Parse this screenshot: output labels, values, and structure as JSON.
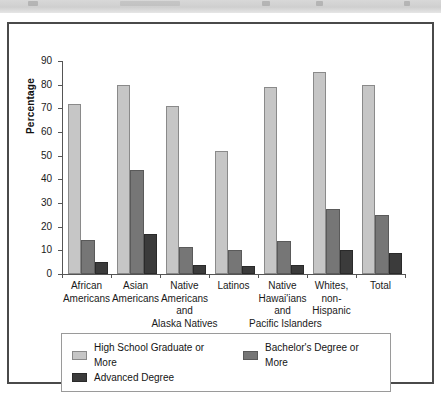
{
  "figure": {
    "top_band_present": true,
    "frame_border_color": "#4a4a4a"
  },
  "chart_data": {
    "type": "bar",
    "title": "",
    "xlabel": "",
    "ylabel": "Percentage",
    "ylim": [
      0,
      90
    ],
    "yticks": [
      0,
      10,
      20,
      30,
      40,
      50,
      60,
      70,
      80,
      90
    ],
    "grid": false,
    "legend_position": "bottom",
    "categories": [
      "African\nAmericans",
      "Asian\nAmericans",
      "Native\nAmericans\nand\nAlaska Natives",
      "Latinos",
      "Native\nHawai'ians\nand\nPacific Islanders",
      "Whites,\nnon-\nHispanic",
      "Total"
    ],
    "category_lines": [
      [
        "African",
        "Americans"
      ],
      [
        "Asian",
        "Americans"
      ],
      [
        "Native",
        "Americans",
        "and",
        "Alaska Natives"
      ],
      [
        "Latinos"
      ],
      [
        "Native",
        "Hawai'ians",
        "and",
        "Pacific Islanders"
      ],
      [
        "Whites,",
        "non-",
        "Hispanic"
      ],
      [
        "Total"
      ]
    ],
    "series": [
      {
        "name": "High School Graduate or More",
        "color": "#c6c6c6",
        "values": [
          72,
          80,
          71,
          52,
          79,
          85.5,
          80
        ]
      },
      {
        "name": "Bachelor's Degree or More",
        "color": "#767676",
        "values": [
          14.5,
          44,
          11.5,
          10,
          14,
          27.5,
          25
        ]
      },
      {
        "name": "Advanced Degree",
        "color": "#3b3b3b",
        "values": [
          5,
          17,
          4,
          3.5,
          4,
          10,
          9
        ]
      }
    ]
  },
  "legend": {
    "items": [
      {
        "label": "High School Graduate or More",
        "color": "#c6c6c6"
      },
      {
        "label": "Bachelor's Degree or More",
        "color": "#767676"
      },
      {
        "label": "Advanced Degree",
        "color": "#3b3b3b"
      }
    ]
  }
}
